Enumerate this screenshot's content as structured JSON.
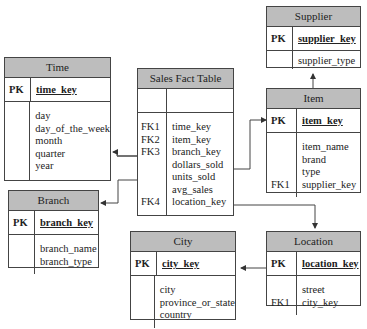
{
  "diagram": {
    "type": "star-schema-er",
    "colors": {
      "header_fill": "#bdbdbd",
      "border": "#444444",
      "line": "#333333"
    }
  },
  "tables": {
    "supplier": {
      "title": "Supplier",
      "pk": {
        "key": "PK",
        "name": "supplier_key"
      },
      "attrs": [
        {
          "key": "",
          "name": "supplier_type"
        }
      ]
    },
    "time": {
      "title": "Time",
      "pk": {
        "key": "PK",
        "name": "time_key"
      },
      "attrs": [
        {
          "key": "",
          "name": "day"
        },
        {
          "key": "",
          "name": "day_of_the_week"
        },
        {
          "key": "",
          "name": "month"
        },
        {
          "key": "",
          "name": "quarter"
        },
        {
          "key": "",
          "name": "year"
        }
      ]
    },
    "sales": {
      "title": "Sales Fact Table",
      "attrs": [
        {
          "key": "FK1",
          "name": "time_key"
        },
        {
          "key": "FK2",
          "name": "item_key"
        },
        {
          "key": "FK3",
          "name": "branch_key"
        },
        {
          "key": "",
          "name": "dollars_sold"
        },
        {
          "key": "",
          "name": "units_sold"
        },
        {
          "key": "",
          "name": "avg_sales"
        },
        {
          "key": "FK4",
          "name": "location_key"
        }
      ]
    },
    "item": {
      "title": "Item",
      "pk": {
        "key": "PK",
        "name": "item_key"
      },
      "attrs": [
        {
          "key": "",
          "name": "item_name"
        },
        {
          "key": "",
          "name": "brand"
        },
        {
          "key": "",
          "name": "type"
        },
        {
          "key": "FK1",
          "name": "supplier_key"
        }
      ]
    },
    "branch": {
      "title": "Branch",
      "pk": {
        "key": "PK",
        "name": "branch_key"
      },
      "attrs": [
        {
          "key": "",
          "name": "branch_name"
        },
        {
          "key": "",
          "name": "branch_type"
        }
      ]
    },
    "city": {
      "title": "City",
      "pk": {
        "key": "PK",
        "name": "city_key"
      },
      "attrs": [
        {
          "key": "",
          "name": "city"
        },
        {
          "key": "",
          "name": "province_or_state"
        },
        {
          "key": "",
          "name": "country"
        }
      ]
    },
    "location": {
      "title": "Location",
      "pk": {
        "key": "PK",
        "name": "location_key"
      },
      "attrs": [
        {
          "key": "",
          "name": "street"
        },
        {
          "key": "FK1",
          "name": "city_key"
        }
      ]
    }
  },
  "relationships": [
    {
      "from": "Sales Fact Table.time_key",
      "to": "Time.time_key"
    },
    {
      "from": "Sales Fact Table.item_key",
      "to": "Item.item_key"
    },
    {
      "from": "Sales Fact Table.branch_key",
      "to": "Branch.branch_key"
    },
    {
      "from": "Sales Fact Table.location_key",
      "to": "Location.location_key"
    },
    {
      "from": "Item.supplier_key",
      "to": "Supplier.supplier_key"
    },
    {
      "from": "Location.city_key",
      "to": "City.city_key"
    }
  ]
}
